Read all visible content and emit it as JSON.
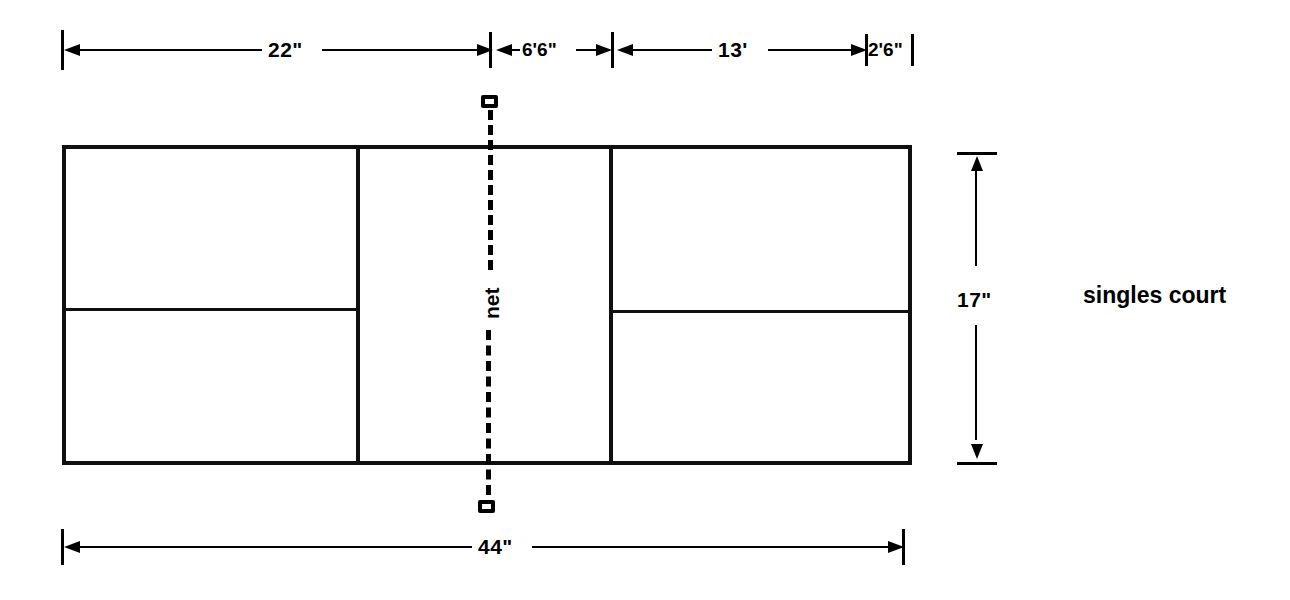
{
  "diagram": {
    "caption": "singles court",
    "net_label": "net",
    "dimensions": {
      "top": [
        {
          "id": "seg-22",
          "label": "22\""
        },
        {
          "id": "seg-6-6",
          "label": "6'6\""
        },
        {
          "id": "seg-13",
          "label": "13'"
        },
        {
          "id": "seg-2-6",
          "label": "2'6\""
        }
      ],
      "bottom": {
        "id": "seg-44",
        "label": "44\""
      },
      "right": {
        "id": "seg-17",
        "label": "17\""
      }
    },
    "colors": {
      "ink": "#000000",
      "court_line": "#101010",
      "background": "#ffffff"
    }
  }
}
